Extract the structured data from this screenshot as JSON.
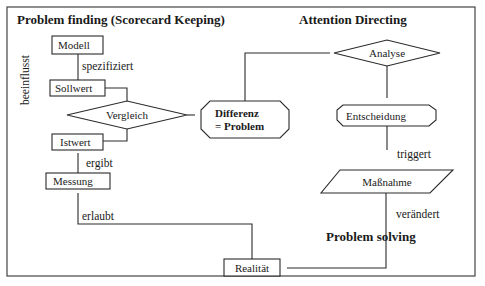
{
  "diagram": {
    "sections": {
      "problem_finding": "Problem finding (Scorecard Keeping)",
      "attention_directing": "Attention Directing",
      "problem_solving": "Problem solving"
    },
    "nodes": {
      "modell": "Modell",
      "sollwert": "Sollwert",
      "vergleich": "Vergleich",
      "istwert": "Istwert",
      "messung": "Messung",
      "differenz_line1": "Differenz",
      "differenz_line2": "= Problem",
      "analyse": "Analyse",
      "entscheidung": "Entscheidung",
      "massnahme": "Maßnahme",
      "realitaet": "Realität"
    },
    "edges": {
      "beeinflusst": "beeinflusst",
      "spezifiziert": "spezifiziert",
      "ergibt": "ergibt",
      "erlaubt": "erlaubt",
      "triggert": "triggert",
      "veraendert": "verändert"
    },
    "colors": {
      "stroke": "#2a2a2a",
      "background": "#ffffff",
      "text": "#1a1a1a"
    }
  }
}
